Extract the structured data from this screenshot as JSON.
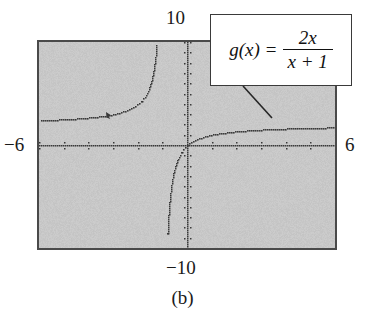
{
  "figure": {
    "caption": "(b)",
    "device": "graphing-calculator-screen"
  },
  "window_labels": {
    "top": "10",
    "bottom": "−10",
    "left": "−6",
    "right": "6"
  },
  "callout": {
    "function_name": "g(x)",
    "equals": "=",
    "numerator": "2x",
    "denominator": "x + 1",
    "full_text": "g(x) = 2x/(x + 1)"
  },
  "colors": {
    "screen_background": "#c9c9c9",
    "screen_border": "#4a4a4a",
    "plot_ink": "#2b2b2b",
    "callout_background": "#ffffff",
    "callout_border": "#3a3a3a",
    "text": "#1a1a1a",
    "page_background": "#ffffff"
  },
  "chart_data": {
    "type": "line",
    "title": "",
    "subtitle": "",
    "xlabel": "",
    "ylabel": "",
    "xlim": [
      -6,
      6
    ],
    "ylim": [
      -10,
      10
    ],
    "grid": false,
    "legend": "none",
    "axes_drawn": [
      "x-axis at y=0",
      "y-axis at x=0"
    ],
    "tick_marks": true,
    "tick_spacing_x": 1,
    "tick_spacing_y": 1,
    "render_style": "dotted",
    "annotations": [
      {
        "text": "g(x) = 2x/(x + 1)",
        "kind": "callout-box",
        "leader_from": [
          243,
          86
        ],
        "leader_to": [
          272,
          118
        ]
      }
    ],
    "series": [
      {
        "name": "g(x) = 2x/(x+1)",
        "expression": "2*x/(x+1)",
        "vertical_asymptote": -1,
        "horizontal_asymptote": 2,
        "x_intercept": 0,
        "y_intercept": 0,
        "branches": [
          {
            "name": "left-branch",
            "domain": [
              -6,
              -1
            ],
            "behavior": "rises from y=2 asymptote on the left to +infinity as x approaches -1 from the left",
            "sample_points": [
              [
                -6.0,
                2.4
              ],
              [
                -5.0,
                2.5
              ],
              [
                -4.0,
                2.67
              ],
              [
                -3.0,
                3.0
              ],
              [
                -2.5,
                3.33
              ],
              [
                -2.0,
                4.0
              ],
              [
                -1.75,
                4.67
              ],
              [
                -1.5,
                6.0
              ],
              [
                -1.33,
                8.0
              ],
              [
                -1.25,
                10.0
              ]
            ]
          },
          {
            "name": "right-branch",
            "domain": [
              -1,
              6
            ],
            "behavior": "rises from -infinity as x approaches -1 from the right, through the origin, flattening toward y=2",
            "sample_points": [
              [
                -0.8,
                -8.0
              ],
              [
                -0.75,
                -6.0
              ],
              [
                -0.67,
                -4.0
              ],
              [
                -0.5,
                -2.0
              ],
              [
                -0.25,
                -0.67
              ],
              [
                0.0,
                0.0
              ],
              [
                0.5,
                0.67
              ],
              [
                1.0,
                1.0
              ],
              [
                2.0,
                1.33
              ],
              [
                3.0,
                1.5
              ],
              [
                4.0,
                1.6
              ],
              [
                5.0,
                1.67
              ],
              [
                6.0,
                1.71
              ]
            ]
          }
        ]
      }
    ]
  }
}
